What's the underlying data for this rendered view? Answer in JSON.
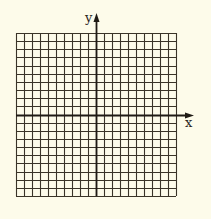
{
  "diagram": {
    "type": "coordinate-grid",
    "grid": {
      "columns": 20,
      "rows": 20,
      "left": 16,
      "top": 33,
      "right": 176,
      "bottom": 196,
      "line_color": "#3a3328",
      "background": "#fdfbea"
    },
    "axes": {
      "x_label": "x",
      "y_label": "y",
      "x_axis_row": 10,
      "y_axis_col": 10,
      "axis_color": "#1f1a14"
    }
  }
}
